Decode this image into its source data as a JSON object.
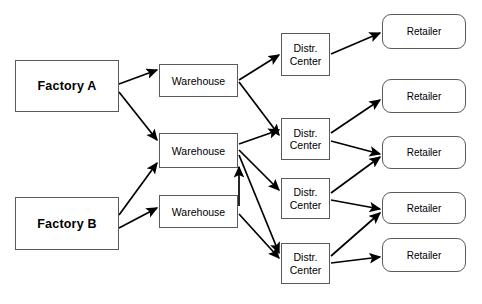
{
  "diagram": {
    "background_color": "#ffffff",
    "stroke_color": "#000000",
    "box_border_color": "#5a5a5a",
    "columns": [
      "Factories",
      "Warehouses",
      "Distribution Centers",
      "Retailers"
    ]
  },
  "nodes": {
    "factories": [
      {
        "id": "factory-a",
        "label": "Factory A",
        "x": 15,
        "y": 60,
        "w": 104,
        "h": 52
      },
      {
        "id": "factory-b",
        "label": "Factory B",
        "x": 15,
        "y": 197,
        "w": 104,
        "h": 53
      }
    ],
    "warehouses": [
      {
        "id": "warehouse-1",
        "label": "Warehouse",
        "x": 159,
        "y": 64,
        "w": 79,
        "h": 33
      },
      {
        "id": "warehouse-2",
        "label": "Warehouse",
        "x": 159,
        "y": 133,
        "w": 79,
        "h": 35
      },
      {
        "id": "warehouse-3",
        "label": "Warehouse",
        "x": 159,
        "y": 195,
        "w": 79,
        "h": 33
      }
    ],
    "distribution_centers": [
      {
        "id": "dc-1",
        "line1": "Distr.",
        "line2": "Center",
        "x": 281,
        "y": 33,
        "w": 49,
        "h": 43
      },
      {
        "id": "dc-2",
        "line1": "Distr.",
        "line2": "Center",
        "x": 281,
        "y": 118,
        "w": 49,
        "h": 42
      },
      {
        "id": "dc-3",
        "line1": "Distr.",
        "line2": "Center",
        "x": 281,
        "y": 178,
        "w": 49,
        "h": 41
      },
      {
        "id": "dc-4",
        "line1": "Distr.",
        "line2": "Center",
        "x": 281,
        "y": 243,
        "w": 49,
        "h": 41
      }
    ],
    "retailers": [
      {
        "id": "retailer-1",
        "label": "Retailer",
        "x": 382,
        "y": 14,
        "w": 84,
        "h": 35
      },
      {
        "id": "retailer-2",
        "label": "Retailer",
        "x": 382,
        "y": 79,
        "w": 84,
        "h": 34
      },
      {
        "id": "retailer-3",
        "label": "Retailer",
        "x": 382,
        "y": 136,
        "w": 84,
        "h": 33
      },
      {
        "id": "retailer-4",
        "label": "Retailer",
        "x": 382,
        "y": 192,
        "w": 84,
        "h": 32
      },
      {
        "id": "retailer-5",
        "label": "Retailer",
        "x": 382,
        "y": 238,
        "w": 84,
        "h": 34
      }
    ]
  },
  "edges": [
    {
      "from": "factory-a",
      "to": "warehouse-1",
      "x1": 119,
      "y1": 84,
      "x2": 157,
      "y2": 70
    },
    {
      "from": "factory-a",
      "to": "warehouse-2",
      "x1": 119,
      "y1": 92,
      "x2": 157,
      "y2": 140
    },
    {
      "from": "factory-b",
      "to": "warehouse-2",
      "x1": 119,
      "y1": 215,
      "x2": 157,
      "y2": 163
    },
    {
      "from": "factory-b",
      "to": "warehouse-3",
      "x1": 119,
      "y1": 228,
      "x2": 157,
      "y2": 208
    },
    {
      "from": "warehouse-1",
      "to": "dc-1",
      "x1": 239,
      "y1": 80,
      "x2": 279,
      "y2": 55
    },
    {
      "from": "warehouse-1",
      "to": "dc-2",
      "x1": 239,
      "y1": 82,
      "x2": 279,
      "y2": 135
    },
    {
      "from": "warehouse-2",
      "to": "dc-2",
      "x1": 239,
      "y1": 144,
      "x2": 279,
      "y2": 130
    },
    {
      "from": "warehouse-2",
      "to": "dc-3",
      "x1": 239,
      "y1": 150,
      "x2": 279,
      "y2": 190
    },
    {
      "from": "warehouse-2",
      "to": "dc-4",
      "x1": 239,
      "y1": 155,
      "x2": 279,
      "y2": 253
    },
    {
      "from": "warehouse-3",
      "to": "dc-4",
      "x1": 239,
      "y1": 214,
      "x2": 279,
      "y2": 258
    },
    {
      "from": "warehouse-3",
      "to": "warehouse-2",
      "x1": 239,
      "y1": 206,
      "x2": 239,
      "y2": 167
    },
    {
      "from": "dc-1",
      "to": "retailer-1",
      "x1": 331,
      "y1": 54,
      "x2": 380,
      "y2": 33
    },
    {
      "from": "dc-2",
      "to": "retailer-2",
      "x1": 331,
      "y1": 133,
      "x2": 380,
      "y2": 100
    },
    {
      "from": "dc-2",
      "to": "retailer-3",
      "x1": 331,
      "y1": 141,
      "x2": 380,
      "y2": 154
    },
    {
      "from": "dc-3",
      "to": "retailer-3",
      "x1": 331,
      "y1": 193,
      "x2": 380,
      "y2": 157
    },
    {
      "from": "dc-3",
      "to": "retailer-4",
      "x1": 331,
      "y1": 200,
      "x2": 380,
      "y2": 209
    },
    {
      "from": "dc-4",
      "to": "retailer-4",
      "x1": 331,
      "y1": 256,
      "x2": 380,
      "y2": 213
    },
    {
      "from": "dc-4",
      "to": "retailer-5",
      "x1": 331,
      "y1": 263,
      "x2": 380,
      "y2": 257
    }
  ]
}
